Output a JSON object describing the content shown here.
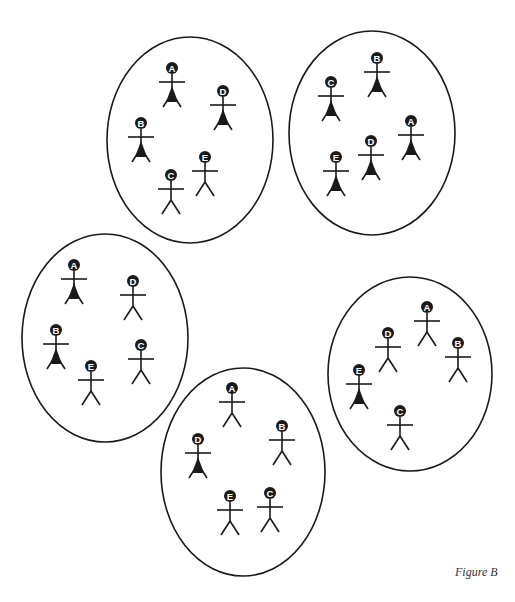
{
  "figure": {
    "caption": "Figure B",
    "stroke_color": "#1a1a1a",
    "fill_color": "#1a1a1a",
    "background": "#ffffff",
    "groups": [
      {
        "id": "top-left",
        "ellipse": {
          "cx": 190,
          "cy": 140,
          "rx": 83,
          "ry": 103
        },
        "people": [
          {
            "label": "A",
            "x": 172,
            "y": 68,
            "filled": true
          },
          {
            "label": "D",
            "x": 223,
            "y": 91,
            "filled": true
          },
          {
            "label": "B",
            "x": 141,
            "y": 123,
            "filled": true
          },
          {
            "label": "E",
            "x": 205,
            "y": 157,
            "filled": false
          },
          {
            "label": "C",
            "x": 171,
            "y": 175,
            "filled": false
          }
        ]
      },
      {
        "id": "top-right",
        "ellipse": {
          "cx": 372,
          "cy": 133,
          "rx": 83,
          "ry": 102
        },
        "people": [
          {
            "label": "B",
            "x": 377,
            "y": 58,
            "filled": true
          },
          {
            "label": "C",
            "x": 331,
            "y": 82,
            "filled": true
          },
          {
            "label": "A",
            "x": 411,
            "y": 121,
            "filled": true
          },
          {
            "label": "D",
            "x": 371,
            "y": 141,
            "filled": true
          },
          {
            "label": "E",
            "x": 336,
            "y": 157,
            "filled": true
          }
        ]
      },
      {
        "id": "middle-left",
        "ellipse": {
          "cx": 105,
          "cy": 338,
          "rx": 83,
          "ry": 104
        },
        "people": [
          {
            "label": "A",
            "x": 74,
            "y": 265,
            "filled": true
          },
          {
            "label": "D",
            "x": 133,
            "y": 281,
            "filled": false
          },
          {
            "label": "B",
            "x": 56,
            "y": 330,
            "filled": true
          },
          {
            "label": "C",
            "x": 141,
            "y": 345,
            "filled": false
          },
          {
            "label": "E",
            "x": 91,
            "y": 366,
            "filled": false
          }
        ]
      },
      {
        "id": "right",
        "ellipse": {
          "cx": 410,
          "cy": 374,
          "rx": 82,
          "ry": 97
        },
        "people": [
          {
            "label": "A",
            "x": 427,
            "y": 307,
            "filled": false
          },
          {
            "label": "D",
            "x": 388,
            "y": 333,
            "filled": false
          },
          {
            "label": "B",
            "x": 458,
            "y": 343,
            "filled": false
          },
          {
            "label": "E",
            "x": 359,
            "y": 370,
            "filled": true
          },
          {
            "label": "C",
            "x": 400,
            "y": 411,
            "filled": false
          }
        ]
      },
      {
        "id": "bottom-middle",
        "ellipse": {
          "cx": 243,
          "cy": 472,
          "rx": 82,
          "ry": 104
        },
        "people": [
          {
            "label": "A",
            "x": 232,
            "y": 388,
            "filled": false
          },
          {
            "label": "B",
            "x": 282,
            "y": 426,
            "filled": false
          },
          {
            "label": "D",
            "x": 198,
            "y": 439,
            "filled": true
          },
          {
            "label": "C",
            "x": 270,
            "y": 493,
            "filled": false
          },
          {
            "label": "E",
            "x": 230,
            "y": 496,
            "filled": false
          }
        ]
      }
    ]
  },
  "clipped_text": "The frequent change of seating in the classroom..."
}
